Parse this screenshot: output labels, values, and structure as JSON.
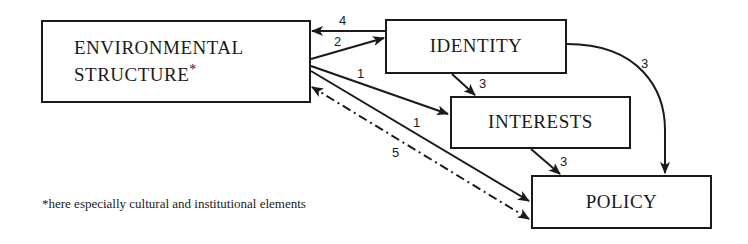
{
  "nodes": {
    "environment": {
      "line1": "ENVIRONMENTAL",
      "line2": "STRUCTURE",
      "marker": "*"
    },
    "identity": {
      "label": "IDENTITY"
    },
    "interests": {
      "label": "INTERESTS"
    },
    "policy": {
      "label": "POLICY"
    }
  },
  "edges": [
    {
      "from": "identity",
      "to": "environment",
      "label": "4",
      "style": "solid"
    },
    {
      "from": "environment",
      "to": "identity",
      "label": "2",
      "style": "solid"
    },
    {
      "from": "environment",
      "to": "interests",
      "label": "1",
      "style": "solid"
    },
    {
      "from": "environment",
      "to": "policy",
      "label": "1",
      "style": "solid"
    },
    {
      "from": "policy",
      "to": "environment",
      "label": "5",
      "style": "dash-dot"
    },
    {
      "from": "identity",
      "to": "interests",
      "label": "3",
      "style": "solid"
    },
    {
      "from": "identity",
      "to": "policy",
      "label": "3",
      "style": "solid-curved"
    },
    {
      "from": "interests",
      "to": "policy",
      "label": "3",
      "style": "solid"
    }
  ],
  "footnote": "*here especially cultural and institutional elements",
  "colors": {
    "ink": "#1a1a1a",
    "background": "#ffffff"
  }
}
